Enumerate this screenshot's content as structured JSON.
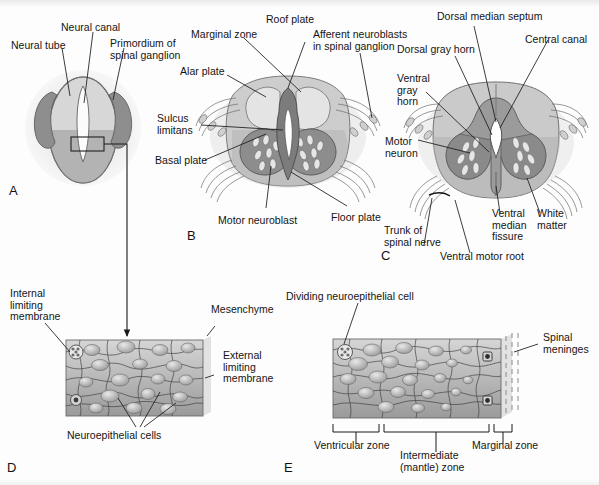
{
  "figure": {
    "type": "anatomical-diagram",
    "panels": [
      "A",
      "B",
      "C",
      "D",
      "E"
    ],
    "background_color": "#fdfdfd",
    "line_color": "#141414",
    "palette": {
      "halo": "#ececec",
      "light_gray": "#d9d9d9",
      "mid_gray": "#b9b9b9",
      "dark_gray": "#8d8d8d",
      "darker_gray": "#7b7b7b",
      "outline": "#555555",
      "white": "#ffffff",
      "cell_gray": "#a9a9a9"
    }
  },
  "panels": {
    "a": {
      "letter": "A",
      "labels": [
        {
          "id": "neural-tube",
          "text": "Neural tube"
        },
        {
          "id": "neural-canal",
          "text": "Neural canal"
        },
        {
          "id": "primordium-spinal-ganglion",
          "text": "Primordium of\nspinal ganglion"
        }
      ]
    },
    "b": {
      "letter": "B",
      "labels": [
        {
          "id": "marginal-zone",
          "text": "Marginal zone"
        },
        {
          "id": "roof-plate",
          "text": "Roof plate"
        },
        {
          "id": "afferent-neuroblasts",
          "text": "Afferent neuroblasts\nin spinal ganglion"
        },
        {
          "id": "alar-plate",
          "text": "Alar plate"
        },
        {
          "id": "sulcus-limitans",
          "text": "Sulcus\nlimitans"
        },
        {
          "id": "basal-plate",
          "text": "Basal plate"
        },
        {
          "id": "motor-neuroblast",
          "text": "Motor neuroblast"
        },
        {
          "id": "floor-plate",
          "text": "Floor plate"
        }
      ]
    },
    "c": {
      "letter": "C",
      "labels": [
        {
          "id": "dorsal-median-septum",
          "text": "Dorsal median septum"
        },
        {
          "id": "central-canal",
          "text": "Central canal"
        },
        {
          "id": "dorsal-gray-horn",
          "text": "Dorsal gray horn"
        },
        {
          "id": "ventral-gray-horn",
          "text": "Ventral\ngray\nhorn"
        },
        {
          "id": "motor-neuron",
          "text": "Motor\nneuron"
        },
        {
          "id": "trunk-spinal-nerve",
          "text": "Trunk of\nspinal nerve"
        },
        {
          "id": "ventral-median-fissure",
          "text": "Ventral\nmedian\nfissure"
        },
        {
          "id": "white-matter",
          "text": "White\nmatter"
        },
        {
          "id": "ventral-motor-root",
          "text": "Ventral motor root"
        }
      ]
    },
    "d": {
      "letter": "D",
      "labels": [
        {
          "id": "internal-limiting-membrane",
          "text": "Internal\nlimiting\nmembrane"
        },
        {
          "id": "mesenchyme",
          "text": "Mesenchyme"
        },
        {
          "id": "external-limiting-membrane",
          "text": "External\nlimiting\nmembrane"
        },
        {
          "id": "neuroepithelial-cells",
          "text": "Neuroepithelial cells"
        }
      ]
    },
    "e": {
      "letter": "E",
      "labels": [
        {
          "id": "dividing-neuroepithelial-cell",
          "text": "Dividing neuroepithelial cell"
        },
        {
          "id": "spinal-meninges",
          "text": "Spinal\nmeninges"
        },
        {
          "id": "ventricular-zone",
          "text": "Ventricular zone"
        },
        {
          "id": "intermediate-mantle-zone",
          "text": "Intermediate\n(mantle) zone"
        },
        {
          "id": "marginal-zone",
          "text": "Marginal zone"
        }
      ]
    }
  }
}
